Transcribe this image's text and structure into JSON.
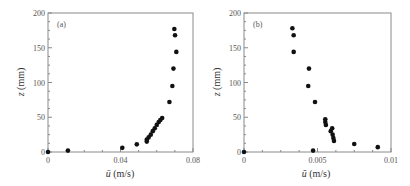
{
  "chart_data": [
    {
      "type": "scatter",
      "panel_label": "(a)",
      "xlabel": "ū (m/s)",
      "ylabel": "z (mm)",
      "xlim": [
        0,
        0.08
      ],
      "ylim": [
        0,
        200
      ],
      "xticks": [
        0,
        0.04,
        0.08
      ],
      "xtick_labels": [
        "0",
        "0.04",
        "0.08"
      ],
      "yticks": [
        0,
        50,
        100,
        150,
        200
      ],
      "ytick_labels": [
        "0",
        "50",
        "100",
        "150",
        "200"
      ],
      "grid": false,
      "legend": null,
      "series": [
        {
          "name": "mean velocity",
          "marker": "filled-circle",
          "color": "#111111",
          "points": [
            [
              0.0,
              0
            ],
            [
              0.011,
              2
            ],
            [
              0.041,
              6
            ],
            [
              0.049,
              11
            ],
            [
              0.0545,
              15
            ],
            [
              0.0545,
              18
            ],
            [
              0.0555,
              21
            ],
            [
              0.0567,
              25
            ],
            [
              0.0578,
              30
            ],
            [
              0.0589,
              34
            ],
            [
              0.06,
              39
            ],
            [
              0.0611,
              43
            ],
            [
              0.062,
              46
            ],
            [
              0.063,
              49
            ],
            [
              0.067,
              72
            ],
            [
              0.0686,
              95
            ],
            [
              0.0692,
              120
            ],
            [
              0.0708,
              144
            ],
            [
              0.0701,
              168
            ],
            [
              0.0697,
              177
            ]
          ]
        }
      ]
    },
    {
      "type": "scatter",
      "panel_label": "(b)",
      "xlabel": "ũ (m/s)",
      "ylabel": "z (mm)",
      "xlim": [
        0,
        0.01
      ],
      "ylim": [
        0,
        200
      ],
      "xticks": [
        0,
        0.005,
        0.01
      ],
      "xtick_labels": [
        "0",
        "0.005",
        "0.01"
      ],
      "yticks": [
        0,
        50,
        100,
        150,
        200
      ],
      "ytick_labels": [
        "0",
        "50",
        "100",
        "150",
        "200"
      ],
      "grid": false,
      "legend": null,
      "series": [
        {
          "name": "fluctuating velocity",
          "marker": "filled-circle",
          "color": "#111111",
          "points": [
            [
              0.0,
              0
            ],
            [
              0.0047,
              2
            ],
            [
              0.0091,
              7
            ],
            [
              0.0075,
              11.5
            ],
            [
              0.00612,
              16
            ],
            [
              0.00608,
              20
            ],
            [
              0.00603,
              25
            ],
            [
              0.0059,
              30
            ],
            [
              0.006,
              34
            ],
            [
              0.00557,
              39
            ],
            [
              0.00553,
              43
            ],
            [
              0.00553,
              47
            ],
            [
              0.00483,
              72
            ],
            [
              0.00437,
              95
            ],
            [
              0.00442,
              120
            ],
            [
              0.00338,
              144
            ],
            [
              0.00338,
              168
            ],
            [
              0.00329,
              178
            ]
          ]
        }
      ]
    }
  ],
  "panels": {
    "a": {
      "label": "(a)",
      "xlabel_sym": "ū",
      "xlabel_unit": " (m/s)",
      "ylabel_sym": "z",
      "ylabel_unit": " (mm)"
    },
    "b": {
      "label": "(b)",
      "xlabel_sym": "ũ",
      "xlabel_unit": " (m/s)",
      "ylabel_sym": "z",
      "ylabel_unit": " (mm)"
    }
  },
  "colors": {
    "axis": "#888888",
    "marker": "#111111",
    "text": "#444444"
  }
}
